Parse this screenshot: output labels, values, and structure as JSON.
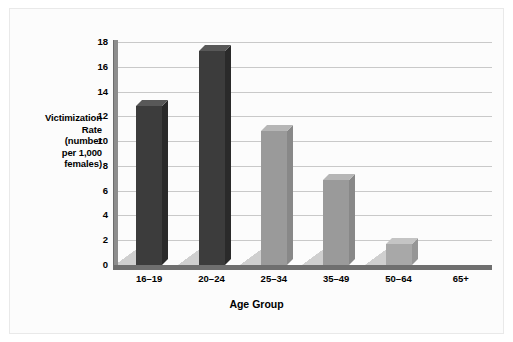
{
  "chart_data": {
    "type": "bar",
    "title": "",
    "xlabel": "Age Group",
    "ylabel": "Victimization Rate (number per 1,000 females)",
    "ylabel_lines": [
      "Victimization",
      "Rate",
      "(number",
      "per 1,000",
      "females)"
    ],
    "categories": [
      "16–19",
      "20–24",
      "25–34",
      "35–49",
      "50–64",
      "65+"
    ],
    "values": [
      12.8,
      17.3,
      10.8,
      6.9,
      1.7,
      0
    ],
    "yticks": [
      0,
      2,
      4,
      6,
      8,
      10,
      12,
      14,
      16,
      18
    ],
    "ytick_labels": [
      "0",
      "2",
      "4",
      "6",
      "8",
      "10",
      "12",
      "14",
      "16",
      "18"
    ],
    "ylim": [
      0,
      18
    ],
    "grid": true,
    "legend": "none",
    "bar_colors": [
      "#3c3c3c",
      "#3c3c3c",
      "#9a9a9a",
      "#9a9a9a",
      "#a8a8a8",
      "#a8a8a8"
    ],
    "style": "3d-column",
    "annotations": []
  },
  "colors": {
    "dark_bar": "#3c3c3c",
    "light_bar": "#9a9a9a",
    "gridline": "#c9c9c9",
    "axis": "#6f6f6f",
    "background": "#fcfcfc",
    "text": "#000000"
  }
}
